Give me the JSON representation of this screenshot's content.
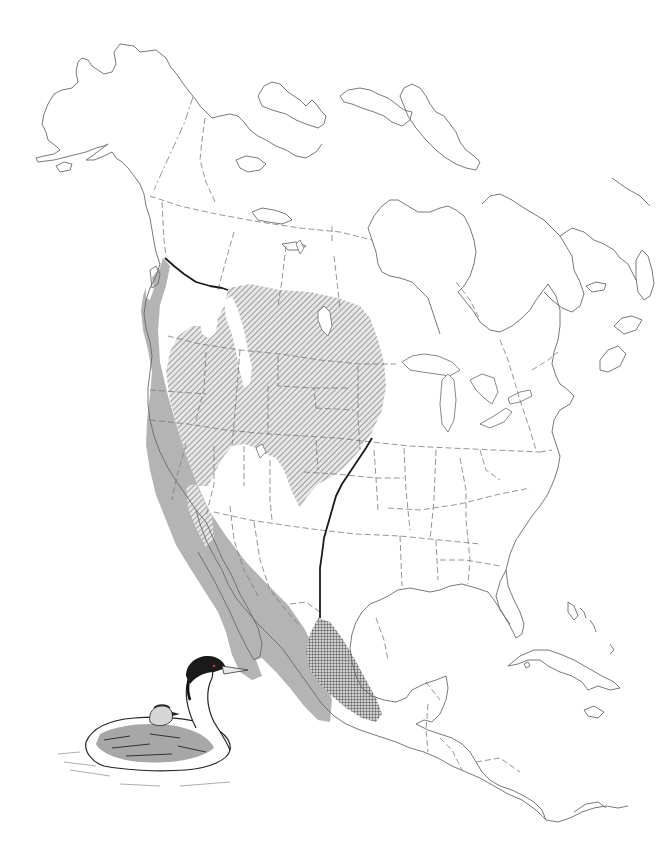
{
  "map": {
    "subject": "North America species range map",
    "region": "North America",
    "range_layers": [
      {
        "name": "winter-range",
        "pattern": "solid-gray",
        "color": "#b4b4b4"
      },
      {
        "name": "breeding-range",
        "pattern": "diagonal-hatch",
        "color": "#9a9a9a"
      },
      {
        "name": "year-round-range",
        "pattern": "crosshatch",
        "color": "#555555"
      }
    ],
    "divide_line": {
      "name": "range-divide-line",
      "color": "#1a1a1a"
    },
    "illustration": {
      "name": "grebe-illustration",
      "description": "grebe with chick riding on back"
    },
    "colors": {
      "background": "#ffffff",
      "coastline": "#6a6a6a",
      "borders": "#7a7a7a",
      "winter_fill": "#b4b4b4",
      "hatch_stroke": "#8a8a8a",
      "crosshatch_stroke": "#444444"
    }
  }
}
